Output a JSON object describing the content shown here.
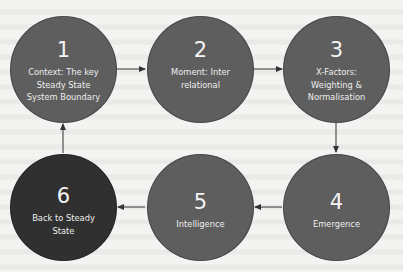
{
  "diagram": {
    "type": "cycle-flow",
    "colors": {
      "node_fill": "#5e5e5e",
      "node_fill_final": "#303030",
      "node_text": "#f2f2f2",
      "arrow": "#333333",
      "background": "#f3f3f1"
    },
    "nodes": [
      {
        "number": "1",
        "label": "Context: The key\nSteady State\nSystem Boundary"
      },
      {
        "number": "2",
        "label": "Moment: Inter\nrelational"
      },
      {
        "number": "3",
        "label": "X-Factors:\nWeighting &\nNormalisation"
      },
      {
        "number": "4",
        "label": "Emergence"
      },
      {
        "number": "5",
        "label": "Intelligence"
      },
      {
        "number": "6",
        "label": "Back to Steady\nState"
      }
    ],
    "edges": [
      {
        "from": "1",
        "to": "2"
      },
      {
        "from": "2",
        "to": "3"
      },
      {
        "from": "3",
        "to": "4"
      },
      {
        "from": "4",
        "to": "5"
      },
      {
        "from": "5",
        "to": "6"
      },
      {
        "from": "6",
        "to": "1"
      }
    ]
  }
}
